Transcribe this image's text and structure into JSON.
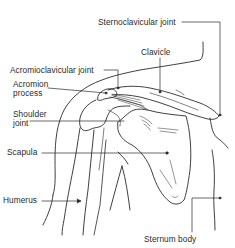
{
  "diagram": {
    "colors": {
      "line": "#2a2a2a",
      "background": "#ffffff"
    },
    "labels": {
      "sternoclavicular_joint": "Sternoclavicular joint",
      "clavicle": "Clavicle",
      "acromioclavicular_joint": "Acromioclavicular joint",
      "acromion_line1": "Acromion",
      "acromion_line2": "process",
      "shoulder_line1": "Shoulder",
      "shoulder_line2": "joint",
      "scapula": "Scapula",
      "humerus": "Humerus",
      "sternum_body": "Sternum body"
    }
  }
}
